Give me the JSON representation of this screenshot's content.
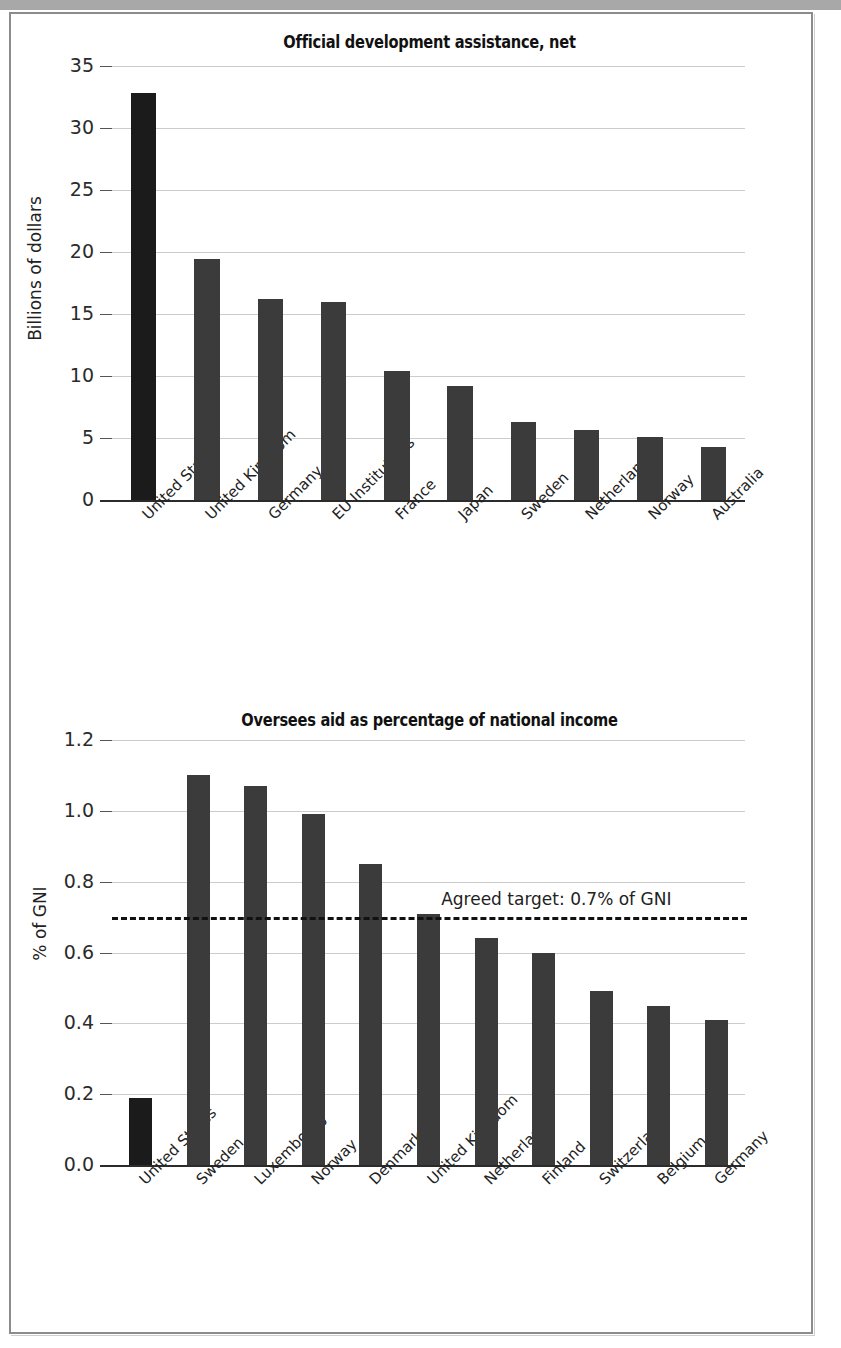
{
  "figure": {
    "background_color": "#ffffff",
    "frame_color": "#8c8c8c",
    "top_band_color": "#a8a8a8",
    "bar_color": "#3b3b3b",
    "highlight_bar_color": "#1b1b1b",
    "gridline_color": "#cccccc"
  },
  "chart_data": [
    {
      "type": "bar",
      "title": "Official development assistance, net",
      "xlabel": "",
      "ylabel": "Billions of dollars",
      "ylim": [
        0,
        35
      ],
      "yticks": [
        "0",
        "5",
        "10",
        "15",
        "20",
        "25",
        "30",
        "35"
      ],
      "ytick_values": [
        0,
        5,
        10,
        15,
        20,
        25,
        30,
        35
      ],
      "grid": true,
      "legend": "none",
      "highlight_index": 0,
      "categories": [
        "United States",
        "United Kingdom",
        "Germany",
        "EU Institutions",
        "France",
        "Japan",
        "Sweden",
        "Netherlands",
        "Norway",
        "Australia"
      ],
      "values": [
        32.8,
        19.4,
        16.2,
        16.0,
        10.4,
        9.2,
        6.3,
        5.65,
        5.1,
        4.3
      ]
    },
    {
      "type": "bar",
      "title": "Oversees aid as percentage of national income",
      "xlabel": "",
      "ylabel": "% of GNI",
      "ylim": [
        0.0,
        1.2
      ],
      "yticks": [
        "0.0",
        "0.2",
        "0.4",
        "0.6",
        "0.8",
        "1.0",
        "1.2"
      ],
      "ytick_values": [
        0.0,
        0.2,
        0.4,
        0.6,
        0.8,
        1.0,
        1.2
      ],
      "grid": true,
      "legend": "none",
      "highlight_index": 0,
      "categories": [
        "United States",
        "Sweden",
        "Luxembourg",
        "Norway",
        "Denmark",
        "United Kingdom",
        "Netherlands",
        "Finland",
        "Switzerland",
        "Belgium",
        "Germany"
      ],
      "values": [
        0.19,
        1.1,
        1.07,
        0.99,
        0.85,
        0.71,
        0.64,
        0.6,
        0.49,
        0.45,
        0.41
      ],
      "annotations": [
        {
          "name": "agreed-target",
          "text": "Agreed target: 0.7% of GNI",
          "value": 0.7,
          "style": "dashed-hline"
        }
      ]
    }
  ]
}
